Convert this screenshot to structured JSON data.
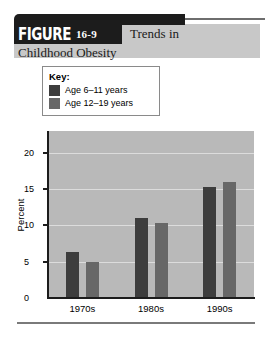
{
  "figure": {
    "tag_word": "FIGURE",
    "tag_number": "16-9",
    "title_line1": "Trends in",
    "title_line2": "Childhood Obesity"
  },
  "legend": {
    "title": "Key:",
    "items": [
      {
        "label": "Age 6–11 years",
        "color": "#3d3d3d"
      },
      {
        "label": "Age 12–19 years",
        "color": "#676767"
      }
    ]
  },
  "chart_data": {
    "type": "bar",
    "title": "Trends in Childhood Obesity",
    "xlabel": "",
    "ylabel": "Percent",
    "categories": [
      "1970s",
      "1980s",
      "1990s"
    ],
    "series": [
      {
        "name": "Age 6–11 years",
        "color": "#3d3d3d",
        "values": [
          6.3,
          11.0,
          15.3
        ]
      },
      {
        "name": "Age 12–19 years",
        "color": "#676767",
        "values": [
          5.0,
          10.3,
          16.0
        ]
      }
    ],
    "ylim": [
      0,
      23
    ],
    "yticks": [
      0,
      5,
      10,
      15,
      20
    ],
    "ytick_labels": [
      "0",
      "5",
      "10",
      "15",
      "20"
    ],
    "grid": true,
    "legend_position": "above-plot",
    "plot_background": "#b9b9b9"
  }
}
